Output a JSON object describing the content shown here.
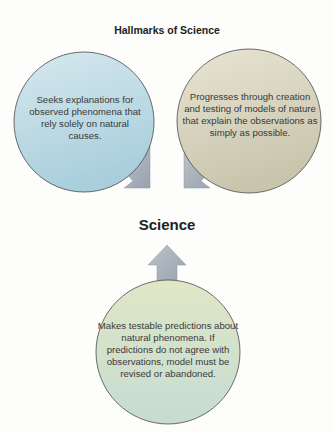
{
  "title": "Hallmarks of Science",
  "center_label": "Science",
  "nodes": [
    {
      "id": "natural-causes",
      "position": "top-left",
      "text": "Seeks explanations for observed phenomena that rely solely on natural causes.",
      "fill_top": "#d6e8ee",
      "fill_bottom": "#a9cfdc"
    },
    {
      "id": "models",
      "position": "top-right",
      "text": "Progresses through creation and testing of models of nature that explain the observations as simply as possible.",
      "fill_top": "#e7e4d3",
      "fill_bottom": "#c9c5ad"
    },
    {
      "id": "testable-predictions",
      "position": "bottom",
      "text": "Makes testable predictions about natural phenomena. If predictions do not agree with observations, model must be revised or abandoned.",
      "fill_top": "#dfe7c6",
      "fill_bottom": "#c6dcd2"
    }
  ],
  "arrows": [
    {
      "from": "natural-causes",
      "to": "Science",
      "direction": "down-right"
    },
    {
      "from": "models",
      "to": "Science",
      "direction": "down-left"
    },
    {
      "from": "testable-predictions",
      "to": "Science",
      "direction": "up"
    }
  ],
  "colors": {
    "arrow_fill": "#a9b3bd",
    "circle_stroke": "#4a4a4a",
    "text": "#3a3a3a"
  }
}
